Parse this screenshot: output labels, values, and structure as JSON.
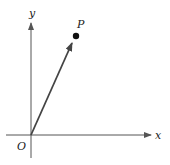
{
  "diagram": {
    "type": "vector-position",
    "axes": {
      "x_label": "x",
      "y_label": "y",
      "origin_label": "O",
      "color": "#555555"
    },
    "point": {
      "label": "P",
      "color": "#111111"
    },
    "vector": {
      "from": "O",
      "to": "P",
      "color": "#444444"
    }
  }
}
